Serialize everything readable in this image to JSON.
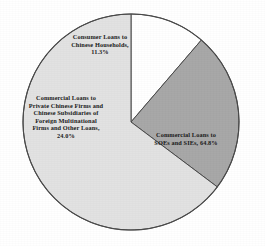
{
  "chart_data": {
    "type": "pie",
    "title": "",
    "subtitle": "",
    "xlabel": "",
    "ylabel": "",
    "legend_position": "none",
    "grid": false,
    "start_angle_deg": 0,
    "direction": "clockwise",
    "categories": [
      "Consumer Loans to Chinese Households",
      "Commercial Loans to Private Chinese Firms and Chinese Subsidiaries of Foreign Multinational Firms and Other Loans",
      "Commercial Loans to SOEs and SIEs"
    ],
    "values": [
      11.3,
      24.0,
      64.8
    ],
    "value_unit": "%",
    "colors": [
      "#FFFFFF",
      "#A8A8A8",
      "#E2E2E2"
    ],
    "outline_color": "#4a4a4a",
    "slices": [
      {
        "name": "Consumer Loans to Chinese Households",
        "value": 11.3,
        "color": "#FFFFFF",
        "label_lines": [
          "Consumer Loans to",
          "Chinese Households,",
          "11.3%"
        ]
      },
      {
        "name": "Commercial Loans to Private Chinese Firms and Chinese Subsidiaries of Foreign Multinational Firms and Other Loans",
        "value": 24.0,
        "color": "#A8A8A8",
        "label_lines": [
          "Commercial Loans to",
          "Private Chinese Firms and",
          "Chinese Subsidiaries of",
          "Foreign Multinational",
          "Firms and Other Loans,",
          "24.0%"
        ]
      },
      {
        "name": "Commercial Loans to SOEs and SIEs",
        "value": 64.8,
        "color": "#E2E2E2",
        "label_lines": [
          "Commercial Loans to",
          "SOEs and SIEs, 64.8%"
        ]
      }
    ]
  },
  "labels": {
    "consumer": {
      "line1": "Consumer Loans to",
      "line2": "Chinese Households,",
      "line3": "11.3%"
    },
    "private": {
      "line1": "Commercial Loans to",
      "line2": "Private Chinese Firms and",
      "line3": "Chinese Subsidiaries of",
      "line4": "Foreign Multinational",
      "line5": "Firms and Other Loans,",
      "line6": "24.0%"
    },
    "soe": {
      "line1": "Commercial Loans to",
      "line2": "SOEs and SIEs, 64.8%"
    }
  }
}
